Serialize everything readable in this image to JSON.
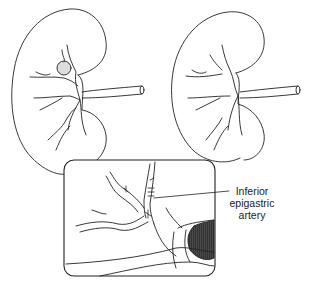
{
  "figure": {
    "panels": [
      {
        "name": "left-kidney",
        "feature": "aneurysm on upper-pole arterial branch"
      },
      {
        "name": "right-kidney",
        "feature": "reconstructed arterial branches"
      },
      {
        "name": "inset",
        "feature": "sutured anastomosis of inferior epigastric artery"
      }
    ],
    "annotations": [
      {
        "id": "inferior-epigastric-artery",
        "lines": [
          "Inferior",
          "epigastric",
          "artery"
        ]
      }
    ]
  }
}
